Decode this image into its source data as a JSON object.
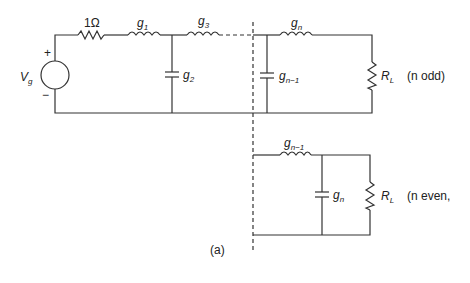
{
  "figure": {
    "caption": "(a)",
    "source": {
      "name": "V",
      "sub": "g",
      "plus": "+",
      "minus": "−"
    },
    "source_resistor": {
      "label": "1Ω"
    },
    "components": [
      {
        "type": "inductor",
        "name": "g",
        "sub": "1"
      },
      {
        "type": "capacitor",
        "name": "g",
        "sub": "2"
      },
      {
        "type": "inductor",
        "name": "g",
        "sub": "3"
      },
      {
        "type": "capacitor",
        "name": "g",
        "sub": "n−1"
      },
      {
        "type": "inductor",
        "name": "g",
        "sub": "n"
      }
    ],
    "load_odd": {
      "name": "R",
      "sub": "L",
      "note": "(n odd)"
    },
    "even_section": {
      "inductor": {
        "name": "g",
        "sub": "n−1"
      },
      "capacitor": {
        "name": "g",
        "sub": "n"
      },
      "load": {
        "name": "R",
        "sub": "L",
        "note": "(n even,"
      }
    }
  }
}
